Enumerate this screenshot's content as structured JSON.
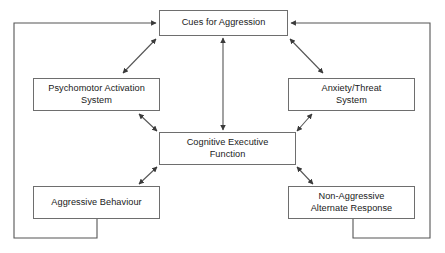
{
  "diagram": {
    "stroke_color": "#555555",
    "box_border_color": "#6e6e6e",
    "text_color": "#1a1a1a",
    "background": "#ffffff",
    "nodes": [
      {
        "id": "cues",
        "label": "Cues for Aggression",
        "name": "node-cues-for-aggression"
      },
      {
        "id": "psychomotor",
        "label": "Psychomotor Activation\nSystem",
        "name": "node-psychomotor-activation-system"
      },
      {
        "id": "anxiety",
        "label": "Anxiety/Threat\nSystem",
        "name": "node-anxiety-threat-system"
      },
      {
        "id": "cognitive",
        "label": "Cognitive Executive\nFunction",
        "name": "node-cognitive-executive-function"
      },
      {
        "id": "aggressive",
        "label": "Aggressive Behaviour",
        "name": "node-aggressive-behaviour"
      },
      {
        "id": "nonaggr",
        "label": "Non-Aggressive\nAlternate Response",
        "name": "node-non-aggressive-alternate-response"
      }
    ],
    "connectors": [
      {
        "id": "cues-psychomotor",
        "from": "cues",
        "to": "psychomotor",
        "style": "double-arrow"
      },
      {
        "id": "cues-anxiety",
        "from": "cues",
        "to": "anxiety",
        "style": "double-arrow"
      },
      {
        "id": "cues-cognitive",
        "from": "cues",
        "to": "cognitive",
        "style": "double-arrow"
      },
      {
        "id": "psychomotor-cognitive",
        "from": "psychomotor",
        "to": "cognitive",
        "style": "double-arrow"
      },
      {
        "id": "anxiety-cognitive",
        "from": "anxiety",
        "to": "cognitive",
        "style": "double-arrow"
      },
      {
        "id": "cognitive-aggressive",
        "from": "cognitive",
        "to": "aggressive",
        "style": "double-arrow"
      },
      {
        "id": "cognitive-nonaggr",
        "from": "cognitive",
        "to": "nonaggr",
        "style": "double-arrow"
      },
      {
        "id": "aggressive-cues-feedback",
        "from": "aggressive",
        "to": "cues",
        "style": "orthogonal-single-arrow"
      },
      {
        "id": "nonaggr-cues-feedback",
        "from": "nonaggr",
        "to": "cues",
        "style": "orthogonal-single-arrow"
      }
    ]
  }
}
